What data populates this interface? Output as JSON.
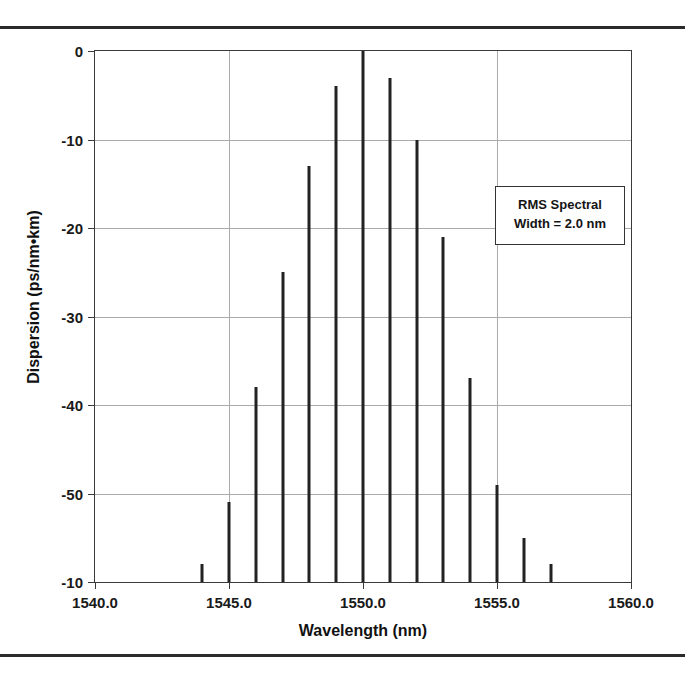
{
  "page": {
    "clipped_caption_above_rule": ""
  },
  "chart_data": {
    "type": "bar",
    "title": "",
    "subtitle": "",
    "xlabel": "Wavelength (nm)",
    "ylabel": "Dispersion (ps/nm•km)",
    "xlim": [
      1540.0,
      1560.0
    ],
    "ylim": [
      -60,
      0
    ],
    "grid": true,
    "legend": "none",
    "x": [
      1544,
      1545,
      1546,
      1547,
      1548,
      1549,
      1550,
      1551,
      1552,
      1553,
      1554,
      1555,
      1556,
      1557
    ],
    "values": [
      -58,
      -51,
      -38,
      -25,
      -13,
      -4,
      0,
      -3,
      -10,
      -21,
      -37,
      -49,
      -55,
      -58
    ],
    "series": [
      {
        "name": "Dispersion",
        "values": [
          -58,
          -51,
          -38,
          -25,
          -13,
          -4,
          0,
          -3,
          -10,
          -21,
          -37,
          -49,
          -55,
          -58
        ]
      }
    ],
    "xticks": [
      {
        "value": 1540.0,
        "label": "1540.0"
      },
      {
        "value": 1545.0,
        "label": "1545.0"
      },
      {
        "value": 1550.0,
        "label": "1550.0"
      },
      {
        "value": 1555.0,
        "label": "1555.0"
      },
      {
        "value": 1560.0,
        "label": "1560.0"
      }
    ],
    "yticks": [
      {
        "value": 0,
        "label": "0"
      },
      {
        "value": -10,
        "label": "-10"
      },
      {
        "value": -20,
        "label": "-20"
      },
      {
        "value": -30,
        "label": "-30"
      },
      {
        "value": -40,
        "label": "-40"
      },
      {
        "value": -50,
        "label": "-50"
      },
      {
        "value": -60,
        "label": "-10"
      }
    ],
    "annotations": [
      {
        "name": "rms-spectral-width-note",
        "line1": "RMS Spectral",
        "line2": "Width = 2.0 nm",
        "x": 1555.0,
        "y": -16
      }
    ],
    "colors": {
      "stem": "#222222",
      "grid": "#aaaaaa",
      "axis": "#3a3a3a",
      "text": "#111111",
      "background": "#ffffff"
    }
  }
}
